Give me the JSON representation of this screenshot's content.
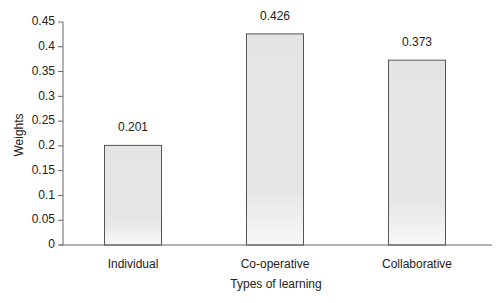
{
  "chart_data": {
    "type": "bar",
    "title": "",
    "xlabel": "Types of learning",
    "ylabel": "Weights",
    "categories": [
      "Individual",
      "Co-operative",
      "Collaborative"
    ],
    "values": [
      0.201,
      0.426,
      0.373
    ],
    "data_labels": [
      "0.201",
      "0.426",
      "0.373"
    ],
    "ylim": [
      0,
      0.45
    ],
    "yticks": [
      0,
      0.05,
      0.1,
      0.15,
      0.2,
      0.25,
      0.3,
      0.35,
      0.4,
      0.45
    ],
    "ytick_labels": [
      "0",
      "0.05",
      "0.1",
      "0.15",
      "0.2",
      "0.25",
      "0.3",
      "0.35",
      "0.4",
      "0.45"
    ],
    "grid": false,
    "legend": null
  },
  "colors": {
    "bar_fill": "#e4e4e4",
    "bar_fill_bottom": "#f7f7f7",
    "bar_border": "#555555",
    "axis": "#666666",
    "text": "#222222"
  }
}
